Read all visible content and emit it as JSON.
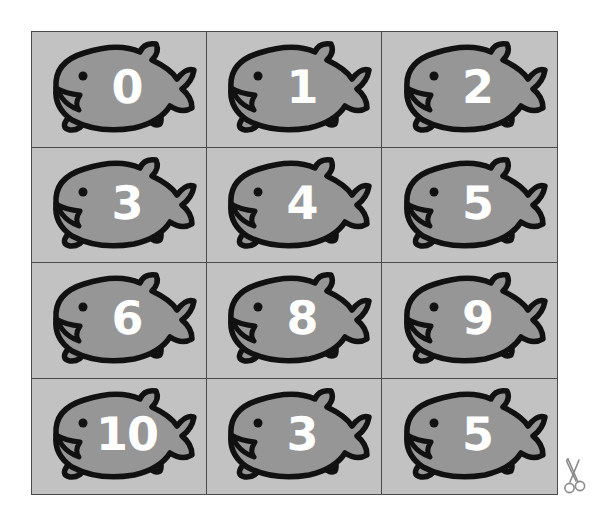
{
  "sheet": {
    "title": "Numbered Fish Cards",
    "columns": 3,
    "rows": 4,
    "background_color": "#c2c2c2",
    "border_color": "#4a4a4a",
    "fish_body_color": "#969696",
    "fish_outline_color": "#111111",
    "number_color": "#ffffff",
    "page_background": "#ffffff"
  },
  "cards": [
    {
      "number": "0",
      "row": 1,
      "col": 1
    },
    {
      "number": "1",
      "row": 1,
      "col": 2
    },
    {
      "number": "2",
      "row": 1,
      "col": 3
    },
    {
      "number": "3",
      "row": 2,
      "col": 1
    },
    {
      "number": "4",
      "row": 2,
      "col": 2
    },
    {
      "number": "5",
      "row": 2,
      "col": 3
    },
    {
      "number": "6",
      "row": 3,
      "col": 1
    },
    {
      "number": "8",
      "row": 3,
      "col": 2
    },
    {
      "number": "9",
      "row": 3,
      "col": 3
    },
    {
      "number": "10",
      "row": 4,
      "col": 1
    },
    {
      "number": "3",
      "row": 4,
      "col": 2
    },
    {
      "number": "5",
      "row": 4,
      "col": 3
    }
  ],
  "marker": {
    "icon": "scissors-icon",
    "color": "#8a8a8a"
  }
}
